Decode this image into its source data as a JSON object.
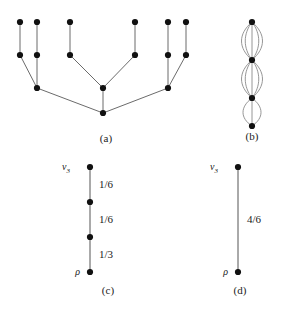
{
  "figure": {
    "title": "",
    "panels": [
      {
        "id": "a",
        "caption": "(a)",
        "type": "tree",
        "description": "rooted tree with root at bottom",
        "nodes": [
          {
            "id": "root",
            "x": 103,
            "y": 105,
            "level": 0
          },
          {
            "id": "i1",
            "x": 37,
            "y": 80,
            "level": 1
          },
          {
            "id": "i2",
            "x": 103,
            "y": 80,
            "level": 1
          },
          {
            "id": "i3",
            "x": 168,
            "y": 80,
            "level": 1
          },
          {
            "id": "m1",
            "x": 20,
            "y": 47,
            "level": 2
          },
          {
            "id": "m2",
            "x": 37,
            "y": 47,
            "level": 2
          },
          {
            "id": "m3",
            "x": 70,
            "y": 47,
            "level": 2
          },
          {
            "id": "m4",
            "x": 135,
            "y": 47,
            "level": 2
          },
          {
            "id": "m5",
            "x": 168,
            "y": 47,
            "level": 2
          },
          {
            "id": "m6",
            "x": 186,
            "y": 47,
            "level": 2
          },
          {
            "id": "t1",
            "x": 20,
            "y": 14,
            "level": 3
          },
          {
            "id": "t2",
            "x": 37,
            "y": 14,
            "level": 3
          },
          {
            "id": "t3",
            "x": 70,
            "y": 14,
            "level": 3
          },
          {
            "id": "t4",
            "x": 135,
            "y": 14,
            "level": 3
          },
          {
            "id": "t5",
            "x": 168,
            "y": 14,
            "level": 3
          },
          {
            "id": "t6",
            "x": 186,
            "y": 14,
            "level": 3
          }
        ],
        "edges": [
          [
            "root",
            "i1"
          ],
          [
            "root",
            "i2"
          ],
          [
            "root",
            "i3"
          ],
          [
            "i1",
            "m1"
          ],
          [
            "i1",
            "m2"
          ],
          [
            "i2",
            "m3"
          ],
          [
            "i2",
            "m4"
          ],
          [
            "i3",
            "m5"
          ],
          [
            "i3",
            "m6"
          ],
          [
            "m1",
            "t1"
          ],
          [
            "m2",
            "t2"
          ],
          [
            "m3",
            "t3"
          ],
          [
            "m4",
            "t4"
          ],
          [
            "m5",
            "t5"
          ],
          [
            "m6",
            "t6"
          ]
        ]
      },
      {
        "id": "b",
        "caption": "(b)",
        "type": "multigraph",
        "description": "vertical chain of vertices joined by parallel edge bundles",
        "nodes": [
          {
            "id": "b0",
            "x": 40,
            "y": 14
          },
          {
            "id": "b1",
            "x": 40,
            "y": 52
          },
          {
            "id": "b2",
            "x": 40,
            "y": 90
          },
          {
            "id": "b3",
            "x": 40,
            "y": 118
          }
        ],
        "bundles": [
          {
            "from": "b0",
            "to": "b1",
            "count": 5
          },
          {
            "from": "b1",
            "to": "b2",
            "count": 5
          },
          {
            "from": "b2",
            "to": "b3",
            "count": 3
          }
        ]
      },
      {
        "id": "c",
        "caption": "(c)",
        "type": "weighted-path",
        "top_vertex_label": "v",
        "top_vertex_sub": "3",
        "bottom_vertex_label": "ρ",
        "nodes": [
          {
            "id": "c3",
            "x": 50,
            "y": 12,
            "label": "v3"
          },
          {
            "id": "c2",
            "x": 50,
            "y": 47,
            "label": ""
          },
          {
            "id": "c1",
            "x": 50,
            "y": 82,
            "label": ""
          },
          {
            "id": "c0",
            "x": 50,
            "y": 117,
            "label": "rho"
          }
        ],
        "edges": [
          {
            "from": "c3",
            "to": "c2",
            "weight": "1/6"
          },
          {
            "from": "c2",
            "to": "c1",
            "weight": "1/6"
          },
          {
            "from": "c1",
            "to": "c0",
            "weight": "1/3"
          }
        ]
      },
      {
        "id": "d",
        "caption": "(d)",
        "type": "weighted-path",
        "top_vertex_label": "v",
        "top_vertex_sub": "3",
        "bottom_vertex_label": "ρ",
        "nodes": [
          {
            "id": "d1",
            "x": 50,
            "y": 12,
            "label": "v3"
          },
          {
            "id": "d0",
            "x": 50,
            "y": 117,
            "label": "rho"
          }
        ],
        "edges": [
          {
            "from": "d1",
            "to": "d0",
            "weight": "4/6"
          }
        ]
      }
    ]
  },
  "colors": {
    "node": "#111111",
    "edge": "#6b6b6b",
    "multi_edge": "#8a8a8a",
    "text": "#1a1a1a",
    "background": "#ffffff"
  },
  "labels": {
    "caption_a": "(a)",
    "caption_b": "(b)",
    "caption_c": "(c)",
    "caption_d": "(d)",
    "v3_base": "v",
    "v3_sub": "3",
    "rho": "ρ",
    "w_c_1": "1/6",
    "w_c_2": "1/6",
    "w_c_3": "1/3",
    "w_d_1": "4/6"
  }
}
